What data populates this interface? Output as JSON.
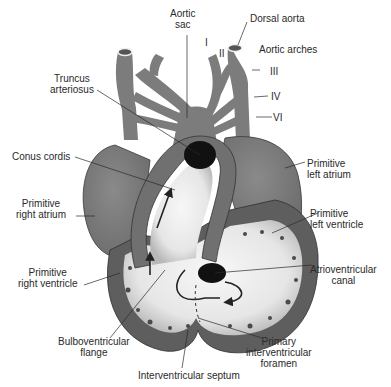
{
  "figure": {
    "colors": {
      "background": "#ffffff",
      "tissue_mid": "#7a7a7a",
      "tissue_dark": "#5e5e5e",
      "lumen_light": "#efefef",
      "opening_black": "#111111",
      "label_text": "#2a2a2a"
    },
    "labels": {
      "aortic_sac": [
        "Aortic",
        "sac"
      ],
      "dorsal_aorta": "Dorsal aorta",
      "aortic_arches": "Aortic arches",
      "arch_I": "I",
      "arch_II": "II",
      "arch_III": "III",
      "arch_IV": "IV",
      "arch_VI": "VI",
      "truncus_arteriosus": [
        "Truncus",
        "arteriosus"
      ],
      "conus_cordis": "Conus cordis",
      "primitive_right_atrium": [
        "Primitive",
        "right atrium"
      ],
      "primitive_left_atrium": [
        "Primitive",
        "left atrium"
      ],
      "primitive_left_ventricle": [
        "Primitive",
        "left ventricle"
      ],
      "primitive_right_ventricle": [
        "Primitive",
        "right ventricle"
      ],
      "atrioventricular_canal": [
        "Atrioventricular",
        "canal"
      ],
      "bulboventricular_flange": [
        "Bulboventricular",
        "flange"
      ],
      "primary_interventricular_foramen": [
        "Primary",
        "interventricular",
        "foramen"
      ],
      "interventricular_septum": "Interventricular septum"
    }
  }
}
